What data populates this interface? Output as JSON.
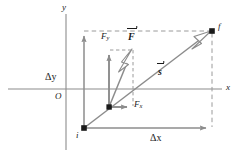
{
  "figure": {
    "background": "#ffffff",
    "width": 239,
    "height": 156,
    "colors": {
      "axis": "#8c8c8c",
      "solid_vector": "#8c8c8c",
      "dashed": "#9a9a9a",
      "arrowhead_fill": "#ffffff",
      "arrowhead_stroke": "#8c8c8c",
      "point_marker": "#1a1a1a",
      "text": "#1a1a1a"
    }
  },
  "axes": {
    "x_label": "x",
    "y_label": "y",
    "origin_label": "O",
    "x_axis": {
      "y": 89,
      "x_start": 8,
      "x_end": 222
    },
    "y_axis": {
      "x": 66,
      "y_start": 14,
      "y_end": 150
    }
  },
  "points": {
    "initial": {
      "label": "i",
      "x": 84,
      "y": 128
    },
    "final": {
      "label": "f",
      "x": 212,
      "y": 31
    },
    "force_origin": {
      "label": "",
      "x": 109,
      "y": 107
    }
  },
  "vectors": [
    {
      "name": "displacement",
      "label": "s",
      "style": "bold-italic-with-overarrow",
      "from": [
        84,
        128
      ],
      "to": [
        212,
        31
      ],
      "arrowhead": "hollow",
      "label_x": 160,
      "label_y": 69
    },
    {
      "name": "force",
      "label": "F",
      "style": "bold-italic-with-overarrow",
      "from": [
        109,
        107
      ],
      "to": [
        133,
        50
      ],
      "arrowhead": "hollow",
      "label_x": 130,
      "label_y": 34
    },
    {
      "name": "force-x-component",
      "label": "F",
      "subscript": "x",
      "style": "italic",
      "from": [
        109,
        107
      ],
      "to": [
        131,
        107
      ],
      "arrowhead": "solid",
      "label_x": 135,
      "label_y": 104
    },
    {
      "name": "force-y-component",
      "label": "F",
      "subscript": "y",
      "style": "italic",
      "from": [
        109,
        107
      ],
      "to": [
        109,
        50
      ],
      "arrowhead": "solid",
      "label_x": 103,
      "label_y": 36
    },
    {
      "name": "delta-y",
      "label": "Δy",
      "style": "upright",
      "from": [
        84,
        128
      ],
      "to": [
        84,
        31
      ],
      "arrowhead": "solid",
      "label_x": 47,
      "label_y": 77
    },
    {
      "name": "delta-x",
      "label": "Δx",
      "style": "upright",
      "from": [
        84,
        128
      ],
      "to": [
        212,
        128
      ],
      "arrowhead": "solid",
      "label_x": 152,
      "label_y": 137
    }
  ],
  "dashed_guides": [
    {
      "name": "top-horizontal",
      "from": [
        84,
        31
      ],
      "to": [
        212,
        31
      ]
    },
    {
      "name": "right-vertical",
      "from": [
        212,
        31
      ],
      "to": [
        212,
        128
      ]
    },
    {
      "name": "component-horizontal",
      "from": [
        109,
        50
      ],
      "to": [
        133,
        50
      ]
    },
    {
      "name": "component-vertical",
      "from": [
        133,
        50
      ],
      "to": [
        133,
        107
      ]
    }
  ]
}
